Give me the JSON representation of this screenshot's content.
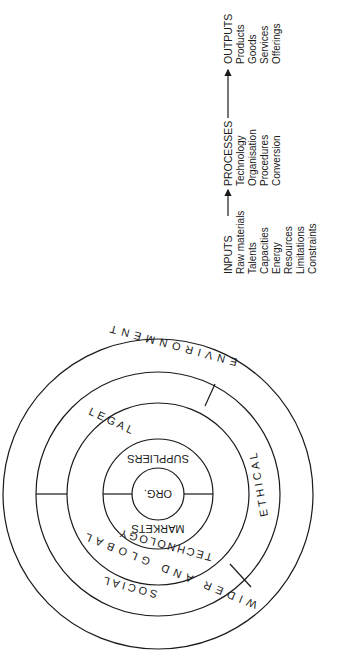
{
  "ipo": {
    "inputs": {
      "heading": "INPUTS",
      "items": [
        "Raw materials",
        "Talents",
        "Capacities",
        "Energy",
        "Resources",
        "Limitations",
        "Constraints"
      ]
    },
    "processes": {
      "heading": "PROCESSES",
      "items": [
        "Technology",
        "Organisation",
        "Procedures",
        "Conversion"
      ]
    },
    "outputs": {
      "heading": "OUTPUTS",
      "items": [
        "Products",
        "Goods",
        "Services",
        "Offerings"
      ]
    }
  },
  "circles": {
    "center": "ORG.",
    "inner_ring": [
      "MARKETS",
      "SUPPLIERS"
    ],
    "technology_ring": "TECHNOLOGY",
    "middle_ring": [
      "SOCIAL",
      "LEGAL",
      "ETHICAL"
    ],
    "outer_ring": [
      "WIDER AND GLOBAL",
      "ENVIRONMENT"
    ]
  },
  "colors": {
    "ink": "#1a1a1a",
    "background": "#ffffff"
  }
}
